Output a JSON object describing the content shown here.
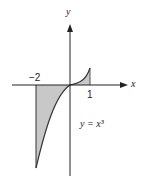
{
  "axes": {
    "x_label": "x",
    "y_label": "y"
  },
  "ticks": {
    "neg_two": "−2",
    "one": "1"
  },
  "equation": "y = x³",
  "colors": {
    "fill": "#c8c8c8",
    "stroke": "#333333"
  }
}
